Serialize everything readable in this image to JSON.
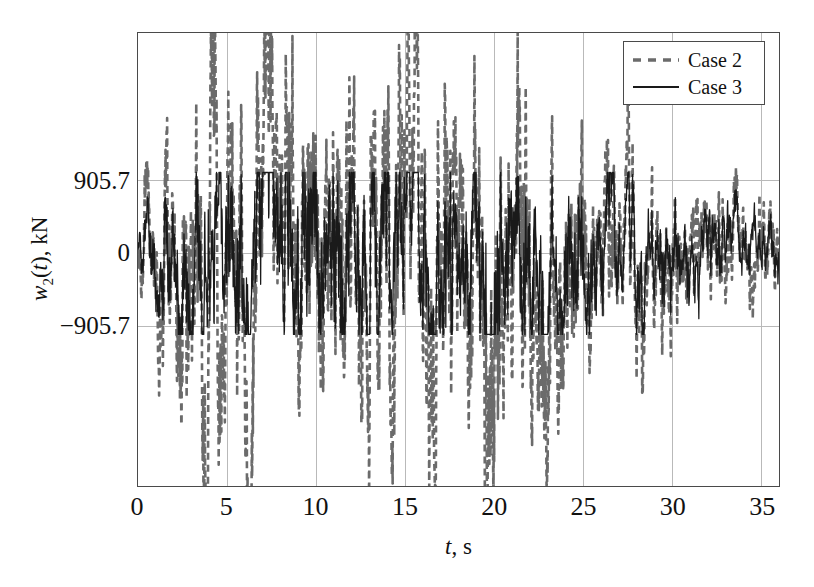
{
  "chart_data": {
    "type": "line",
    "title": "",
    "subtitle": "",
    "xlabel": "t, s",
    "ylabel": "w2(t), kN",
    "xlabel_var": "t",
    "xlabel_unit": ", s",
    "ylabel_var": "w",
    "ylabel_sub": "2",
    "ylabel_arg": "(t)",
    "ylabel_unit": ", kN",
    "xlim": [
      0,
      36
    ],
    "ylim": [
      -2900,
      2750
    ],
    "xticks": [
      0,
      5,
      10,
      15,
      20,
      25,
      30,
      35
    ],
    "xtick_labels": [
      "0",
      "5",
      "10",
      "15",
      "20",
      "25",
      "30",
      "35"
    ],
    "yticks": [
      905.7,
      0,
      -905.7
    ],
    "ytick_labels": [
      "905.7",
      "0",
      "−905.7"
    ],
    "grid": true,
    "grid_color": "#b9b9b9",
    "frame_color": "#4a4a4a",
    "legend_position": "top-right",
    "series": [
      {
        "name": "Case 2",
        "style": "dashed",
        "color": "#6b6b6b",
        "linewidth": 2.6,
        "dash": "7,5",
        "seed": 20231,
        "peak_positive": 2750,
        "peak_negative": -2850,
        "rms_amplitude": 700
      },
      {
        "name": "Case 3",
        "style": "solid",
        "color": "#1a1a1a",
        "linewidth": 1.3,
        "dash": "",
        "seed": 77419,
        "peak_positive": 1050,
        "peak_negative": -1150,
        "rms_amplitude": 470
      }
    ],
    "legend": [
      {
        "label": "Case 2",
        "style": "dashed",
        "color": "#6b6b6b"
      },
      {
        "label": "Case 3",
        "style": "solid",
        "color": "#1a1a1a"
      }
    ]
  }
}
